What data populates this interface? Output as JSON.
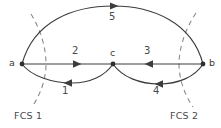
{
  "figure": {
    "type": "directed-graph-diagram",
    "background_color": "#ffffff",
    "line_color": "#3d3d3d",
    "cut_line_color": "#8a8a8a"
  },
  "nodes": [
    {
      "id": "a",
      "label": "a",
      "x": 22,
      "y": 64
    },
    {
      "id": "c",
      "label": "c",
      "x": 113,
      "y": 64
    },
    {
      "id": "b",
      "label": "b",
      "x": 203,
      "y": 64
    }
  ],
  "edges": [
    {
      "id": "e1",
      "label": "1",
      "from": "c",
      "to": "a",
      "direction": "left",
      "shape": "lower-left-arc"
    },
    {
      "id": "e2",
      "label": "2",
      "from": "a",
      "to": "c",
      "direction": "right",
      "shape": "straight"
    },
    {
      "id": "e3",
      "label": "3",
      "from": "b",
      "to": "c",
      "direction": "left",
      "shape": "straight"
    },
    {
      "id": "e4",
      "label": "4",
      "from": "b",
      "to": "c",
      "direction": "left",
      "shape": "lower-right-arc"
    },
    {
      "id": "e5",
      "label": "5",
      "from": "a",
      "to": "b",
      "direction": "right",
      "shape": "upper-arc"
    }
  ],
  "cuts": [
    {
      "id": "fcs1",
      "label": "FCS 1",
      "label_x": 14,
      "label_y": 111
    },
    {
      "id": "fcs2",
      "label": "FCS 2",
      "label_x": 170,
      "label_y": 111
    }
  ],
  "edge_label_positions": {
    "1": {
      "x": 62,
      "y": 86
    },
    "2": {
      "x": 72,
      "y": 46
    },
    "3": {
      "x": 144,
      "y": 46
    },
    "4": {
      "x": 153,
      "y": 86
    },
    "5": {
      "x": 109,
      "y": 12
    }
  },
  "node_label_positions": {
    "a": {
      "x": 9,
      "y": 58
    },
    "c": {
      "x": 110,
      "y": 48
    },
    "b": {
      "x": 209,
      "y": 58
    }
  }
}
